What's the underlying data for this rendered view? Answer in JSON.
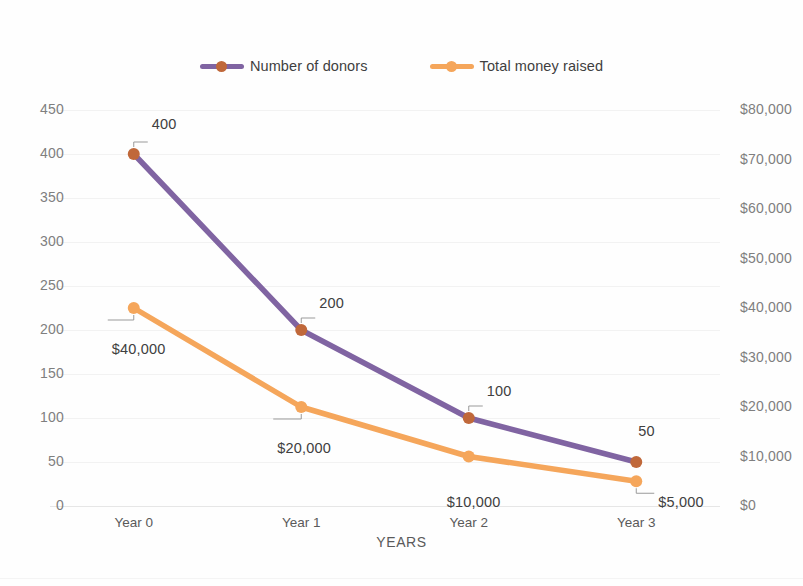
{
  "chart_data": {
    "type": "line",
    "title": "",
    "subtitle": "",
    "xlabel": "YEARS",
    "ylabel": "",
    "categories": [
      "Year 0",
      "Year 1",
      "Year 2",
      "Year 3"
    ],
    "grid": true,
    "legend_position": "top",
    "series": [
      {
        "name": "Number of donors",
        "axis": "left",
        "color": "#8064A2",
        "marker_color": "#C0683A",
        "values": [
          400,
          200,
          100,
          50
        ],
        "data_labels": [
          "400",
          "200",
          "100",
          "50"
        ]
      },
      {
        "name": "Total money raised",
        "axis": "right",
        "color": "#F5A65B",
        "marker_color": "#F5A65B",
        "values": [
          40000,
          20000,
          10000,
          5000
        ],
        "data_labels": [
          "$40,000",
          "$20,000",
          "$10,000",
          "$5,000"
        ]
      }
    ],
    "left_axis": {
      "min": 0,
      "max": 450,
      "step": 50,
      "ticks": [
        "0",
        "50",
        "100",
        "150",
        "200",
        "250",
        "300",
        "350",
        "400",
        "450"
      ]
    },
    "right_axis": {
      "min": 0,
      "max": 80000,
      "step": 10000,
      "ticks": [
        "$0",
        "$10,000",
        "$20,000",
        "$30,000",
        "$40,000",
        "$50,000",
        "$60,000",
        "$70,000",
        "$80,000"
      ]
    }
  },
  "legend": {
    "entries": [
      {
        "label": "Number of donors"
      },
      {
        "label": "Total money raised"
      }
    ]
  }
}
